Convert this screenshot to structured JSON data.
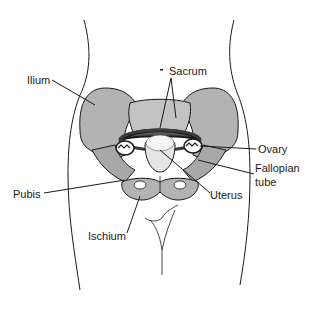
{
  "diagram": {
    "colors": {
      "bone_fill": "#b3b3b3",
      "bone_dark": "#6e6e6e",
      "outline": "#1a1a1a",
      "background": "#ffffff",
      "uterus_fill": "#e6e6e6"
    },
    "labels": {
      "ilium": "Ilium",
      "sacrum": "Sacrum",
      "ovary": "Ovary",
      "fallopian_tube_line1": "Fallopian",
      "fallopian_tube_line2": "tube",
      "pubis": "Pubis",
      "uterus": "Uterus",
      "ischium": "Ischium"
    }
  }
}
